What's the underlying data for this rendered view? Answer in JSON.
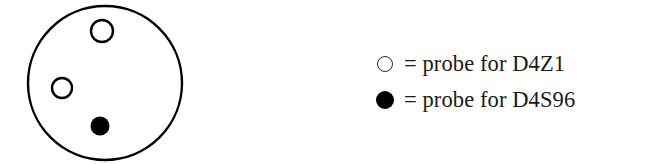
{
  "figure": {
    "background_color": "#ffffff",
    "outline_color": "#000000"
  },
  "nucleus": {
    "label": "nucleus",
    "shape": "circle",
    "center_x": 105,
    "center_y": 83,
    "radius": 77,
    "stroke_width": 2.4,
    "signals": [
      {
        "name": "signal-open-upper",
        "marker": "open-circle",
        "probe": "D4Z1",
        "center_x": 102,
        "center_y": 31,
        "radius": 11,
        "stroke_width": 2.4
      },
      {
        "name": "signal-open-left",
        "marker": "open-circle",
        "probe": "D4Z1",
        "center_x": 62,
        "center_y": 88,
        "radius": 10,
        "stroke_width": 2.4
      },
      {
        "name": "signal-filled-lower",
        "marker": "filled-circle",
        "probe": "D4S96",
        "center_x": 100,
        "center_y": 126,
        "radius": 9.5
      }
    ]
  },
  "legend": {
    "items": [
      {
        "marker": "open-circle",
        "marker_icon": "open-circle-icon",
        "text": "= probe for D4Z1",
        "probe": "D4Z1"
      },
      {
        "marker": "filled-circle",
        "marker_icon": "filled-circle-icon",
        "text": "= probe for D4S96",
        "probe": "D4S96"
      }
    ]
  }
}
